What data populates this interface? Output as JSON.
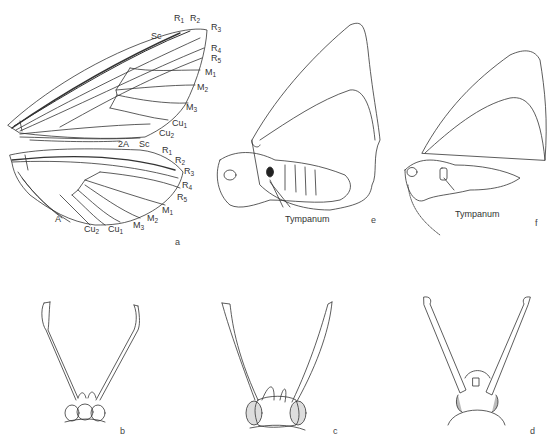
{
  "figure": {
    "panels": {
      "a": "a",
      "b": "b",
      "c": "c",
      "d": "d",
      "e": "e",
      "f": "f"
    },
    "forewing_veins": [
      {
        "id": "sc",
        "base": "Sc",
        "sub": ""
      },
      {
        "id": "r1",
        "base": "R",
        "sub": "1"
      },
      {
        "id": "r2",
        "base": "R",
        "sub": "2"
      },
      {
        "id": "r3",
        "base": "R",
        "sub": "3"
      },
      {
        "id": "r4",
        "base": "R",
        "sub": "4"
      },
      {
        "id": "r5",
        "base": "R",
        "sub": "5"
      },
      {
        "id": "m1",
        "base": "M",
        "sub": "1"
      },
      {
        "id": "m2",
        "base": "M",
        "sub": "2"
      },
      {
        "id": "m3",
        "base": "M",
        "sub": "3"
      },
      {
        "id": "cu1",
        "base": "Cu",
        "sub": "1"
      },
      {
        "id": "cu2",
        "base": "Cu",
        "sub": "2"
      },
      {
        "id": "2a",
        "base": "2A",
        "sub": ""
      }
    ],
    "hindwing_veins": [
      {
        "id": "sc",
        "base": "Sc",
        "sub": ""
      },
      {
        "id": "r1",
        "base": "R",
        "sub": "1"
      },
      {
        "id": "r2",
        "base": "R",
        "sub": "2"
      },
      {
        "id": "r3",
        "base": "R",
        "sub": "3"
      },
      {
        "id": "r4",
        "base": "R",
        "sub": "4"
      },
      {
        "id": "r5",
        "base": "R",
        "sub": "5"
      },
      {
        "id": "m1",
        "base": "M",
        "sub": "1"
      },
      {
        "id": "m2",
        "base": "M",
        "sub": "2"
      },
      {
        "id": "m3",
        "base": "M",
        "sub": "3"
      },
      {
        "id": "cu1",
        "base": "Cu",
        "sub": "1"
      },
      {
        "id": "cu2",
        "base": "Cu",
        "sub": "2"
      },
      {
        "id": "a",
        "base": "A",
        "sub": ""
      }
    ],
    "callouts": {
      "tympanum_e": "Tympanum",
      "tympanum_f": "Tympanum"
    }
  }
}
